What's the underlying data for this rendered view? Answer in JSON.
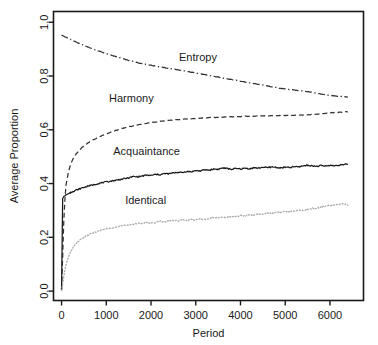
{
  "chart_data": {
    "type": "line",
    "title": "",
    "xlabel": "Period",
    "ylabel": "Average Proportion",
    "xlim": [
      -180,
      6750
    ],
    "ylim": [
      -0.035,
      1.04
    ],
    "grid": false,
    "legend": "inline-labels",
    "xticks": [
      0,
      1000,
      2000,
      3000,
      4000,
      5000,
      6000
    ],
    "xtick_labels": [
      "0",
      "1000",
      "2000",
      "3000",
      "4000",
      "5000",
      "6000"
    ],
    "yticks": [
      0.0,
      0.2,
      0.4,
      0.6,
      0.8,
      1.0
    ],
    "ytick_labels": [
      "0.0",
      "0.2",
      "0.4",
      "0.6",
      "0.8",
      "1.0"
    ],
    "x": [
      0,
      25,
      50,
      75,
      100,
      150,
      200,
      250,
      300,
      400,
      500,
      600,
      700,
      800,
      900,
      1000,
      1100,
      1200,
      1300,
      1400,
      1500,
      1600,
      1700,
      1800,
      1900,
      2000,
      2100,
      2200,
      2300,
      2400,
      2500,
      2600,
      2700,
      2800,
      2900,
      3000,
      3100,
      3200,
      3300,
      3400,
      3500,
      3600,
      3700,
      3800,
      3900,
      4000,
      4100,
      4200,
      4300,
      4400,
      4500,
      4600,
      4700,
      4800,
      4900,
      5000,
      5100,
      5200,
      5300,
      5400,
      5500,
      5600,
      5700,
      5800,
      5900,
      6000,
      6100,
      6200,
      6300,
      6400
    ],
    "series": [
      {
        "name": "Entropy",
        "style": "dashdot",
        "color": "#333333",
        "label_x": 3050,
        "label_y": 0.855,
        "values": [
          0.952,
          0.95,
          0.948,
          0.946,
          0.944,
          0.94,
          0.936,
          0.932,
          0.928,
          0.921,
          0.914,
          0.907,
          0.901,
          0.895,
          0.889,
          0.883,
          0.878,
          0.873,
          0.868,
          0.863,
          0.858,
          0.854,
          0.85,
          0.846,
          0.843,
          0.84,
          0.837,
          0.834,
          0.831,
          0.828,
          0.826,
          0.823,
          0.82,
          0.817,
          0.814,
          0.811,
          0.808,
          0.805,
          0.802,
          0.799,
          0.796,
          0.793,
          0.79,
          0.787,
          0.784,
          0.781,
          0.778,
          0.775,
          0.772,
          0.769,
          0.766,
          0.763,
          0.76,
          0.757,
          0.754,
          0.752,
          0.75,
          0.748,
          0.746,
          0.744,
          0.742,
          0.739,
          0.736,
          0.733,
          0.73,
          0.728,
          0.726,
          0.724,
          0.723,
          0.722
        ]
      },
      {
        "name": "Harmony",
        "style": "dashed",
        "color": "#333333",
        "label_x": 1560,
        "label_y": 0.705,
        "values": [
          0.005,
          0.13,
          0.26,
          0.34,
          0.395,
          0.44,
          0.47,
          0.49,
          0.505,
          0.525,
          0.54,
          0.552,
          0.562,
          0.57,
          0.578,
          0.585,
          0.591,
          0.597,
          0.602,
          0.607,
          0.611,
          0.615,
          0.618,
          0.621,
          0.624,
          0.627,
          0.629,
          0.631,
          0.633,
          0.635,
          0.636,
          0.638,
          0.639,
          0.64,
          0.641,
          0.642,
          0.643,
          0.644,
          0.645,
          0.646,
          0.646,
          0.647,
          0.648,
          0.648,
          0.649,
          0.649,
          0.65,
          0.65,
          0.651,
          0.651,
          0.652,
          0.652,
          0.652,
          0.653,
          0.653,
          0.653,
          0.654,
          0.654,
          0.655,
          0.655,
          0.656,
          0.657,
          0.658,
          0.659,
          0.661,
          0.663,
          0.664,
          0.665,
          0.666,
          0.667
        ]
      },
      {
        "name": "Acquaintance",
        "style": "solid",
        "color": "#1a1a1a",
        "label_x": 1900,
        "label_y": 0.505,
        "values": [
          0.003,
          0.345,
          0.352,
          0.355,
          0.358,
          0.362,
          0.366,
          0.37,
          0.374,
          0.38,
          0.386,
          0.391,
          0.395,
          0.399,
          0.403,
          0.406,
          0.409,
          0.412,
          0.415,
          0.418,
          0.421,
          0.426,
          0.425,
          0.428,
          0.431,
          0.43,
          0.434,
          0.433,
          0.437,
          0.436,
          0.44,
          0.442,
          0.441,
          0.445,
          0.444,
          0.448,
          0.447,
          0.451,
          0.45,
          0.454,
          0.453,
          0.458,
          0.456,
          0.453,
          0.456,
          0.454,
          0.457,
          0.455,
          0.459,
          0.457,
          0.461,
          0.459,
          0.462,
          0.46,
          0.458,
          0.461,
          0.459,
          0.463,
          0.462,
          0.466,
          0.468,
          0.466,
          0.464,
          0.467,
          0.465,
          0.468,
          0.466,
          0.469,
          0.47,
          0.472
        ]
      },
      {
        "name": "Identical",
        "style": "dotted",
        "color": "#aaaaaa",
        "label_x": 1880,
        "label_y": 0.325,
        "values": [
          0.002,
          0.028,
          0.055,
          0.078,
          0.098,
          0.125,
          0.145,
          0.16,
          0.172,
          0.188,
          0.2,
          0.209,
          0.216,
          0.222,
          0.227,
          0.231,
          0.235,
          0.238,
          0.241,
          0.244,
          0.246,
          0.249,
          0.251,
          0.253,
          0.255,
          0.252,
          0.256,
          0.259,
          0.257,
          0.261,
          0.263,
          0.261,
          0.265,
          0.263,
          0.266,
          0.264,
          0.268,
          0.266,
          0.27,
          0.273,
          0.271,
          0.275,
          0.274,
          0.278,
          0.277,
          0.281,
          0.28,
          0.284,
          0.283,
          0.287,
          0.286,
          0.29,
          0.289,
          0.293,
          0.292,
          0.296,
          0.295,
          0.299,
          0.302,
          0.3,
          0.305,
          0.307,
          0.309,
          0.312,
          0.315,
          0.318,
          0.321,
          0.323,
          0.325,
          0.32
        ]
      }
    ]
  }
}
